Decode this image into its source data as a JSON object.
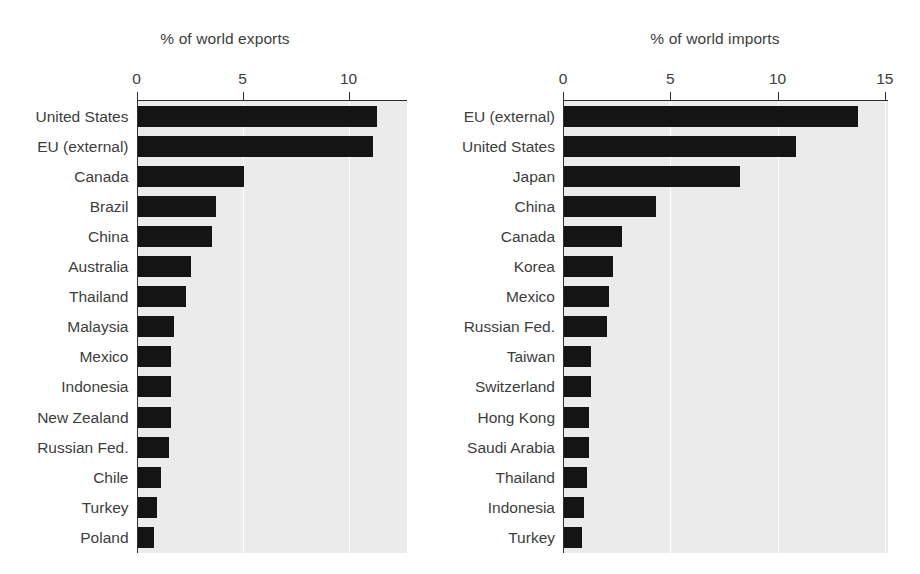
{
  "chart_data": [
    {
      "type": "bar",
      "orientation": "horizontal",
      "title": "% of world exports",
      "xlabel": "",
      "ylabel": "",
      "xlim": [
        0,
        11.8
      ],
      "xticks": [
        0,
        5,
        10
      ],
      "xtick_labels": [
        "0",
        "5",
        "10"
      ],
      "grid": true,
      "grid_axis": "x",
      "legend": "none",
      "bar_color": "#141414",
      "plot_bgcolor": "#ebebeb",
      "categories": [
        "United States",
        "EU (external)",
        "Canada",
        "Brazil",
        "China",
        "Australia",
        "Thailand",
        "Malaysia",
        "Mexico",
        "Indonesia",
        "New Zealand",
        "Russian Fed.",
        "Chile",
        "Turkey",
        "Poland"
      ],
      "values": [
        11.3,
        11.1,
        5.0,
        3.7,
        3.5,
        2.5,
        2.3,
        1.7,
        1.6,
        1.6,
        1.6,
        1.5,
        1.1,
        0.9,
        0.8
      ]
    },
    {
      "type": "bar",
      "orientation": "horizontal",
      "title": "% of world imports",
      "xlabel": "",
      "ylabel": "",
      "xlim": [
        0,
        15.1
      ],
      "xticks": [
        0,
        5,
        10,
        15
      ],
      "xtick_labels": [
        "0",
        "5",
        "10",
        "15"
      ],
      "grid": true,
      "grid_axis": "x",
      "legend": "none",
      "bar_color": "#141414",
      "plot_bgcolor": "#ebebeb",
      "categories": [
        "EU (external)",
        "United States",
        "Japan",
        "China",
        "Canada",
        "Korea",
        "Mexico",
        "Russian Fed.",
        "Taiwan",
        "Switzerland",
        "Hong Kong",
        "Saudi Arabia",
        "Thailand",
        "Indonesia",
        "Turkey"
      ],
      "values": [
        13.7,
        10.8,
        8.2,
        4.3,
        2.7,
        2.3,
        2.1,
        2.0,
        1.25,
        1.25,
        1.15,
        1.15,
        1.05,
        0.95,
        0.85
      ]
    }
  ]
}
